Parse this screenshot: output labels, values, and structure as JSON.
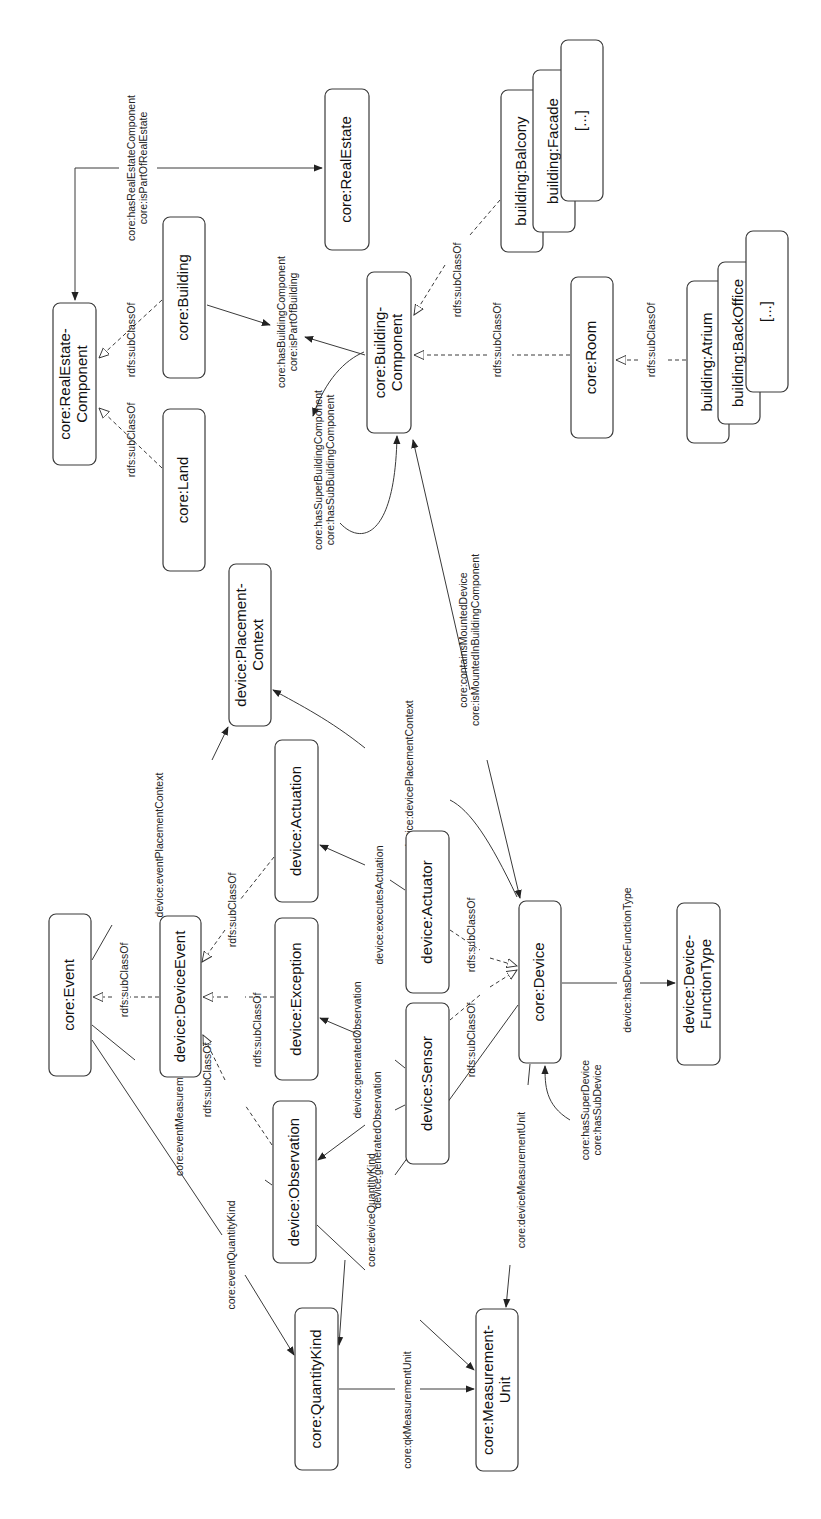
{
  "diagram": {
    "orientation": "rotated -90deg (text reads bottom-to-top)",
    "nodes": [
      {
        "id": "realestate_component",
        "lines": [
          "core:RealEstate-",
          "Component"
        ],
        "x": 53,
        "y": 303,
        "w": 43,
        "h": 162
      },
      {
        "id": "realestate",
        "lines": [
          "core:RealEstate"
        ],
        "x": 325,
        "y": 89,
        "w": 44,
        "h": 161
      },
      {
        "id": "building",
        "lines": [
          "core:Building"
        ],
        "x": 163,
        "y": 217,
        "w": 42,
        "h": 161
      },
      {
        "id": "land",
        "lines": [
          "core:Land"
        ],
        "x": 163,
        "y": 409,
        "w": 42,
        "h": 162
      },
      {
        "id": "building_component",
        "lines": [
          "core:Building-",
          "Component"
        ],
        "x": 367,
        "y": 272,
        "w": 44,
        "h": 161
      },
      {
        "id": "room",
        "lines": [
          "core:Room"
        ],
        "x": 571,
        "y": 277,
        "w": 42,
        "h": 161
      },
      {
        "id": "balcony",
        "lines": [
          "building:Balcony"
        ],
        "x": 501,
        "y": 90,
        "w": 42,
        "h": 162
      },
      {
        "id": "facade",
        "lines": [
          "building:Facade"
        ],
        "x": 533,
        "y": 70,
        "w": 42,
        "h": 162
      },
      {
        "id": "bc_more",
        "lines": [
          "[...]"
        ],
        "x": 561,
        "y": 40,
        "w": 42,
        "h": 161
      },
      {
        "id": "atrium",
        "lines": [
          "building:Atrium"
        ],
        "x": 687,
        "y": 281,
        "w": 42,
        "h": 162
      },
      {
        "id": "backoffice",
        "lines": [
          "building:BackOffice"
        ],
        "x": 718,
        "y": 262,
        "w": 42,
        "h": 162
      },
      {
        "id": "room_more",
        "lines": [
          "[...]"
        ],
        "x": 746,
        "y": 231,
        "w": 42,
        "h": 161
      },
      {
        "id": "placement_context",
        "lines": [
          "device:Placement-",
          "Context"
        ],
        "x": 229,
        "y": 564,
        "w": 42,
        "h": 162
      },
      {
        "id": "event",
        "lines": [
          "core:Event"
        ],
        "x": 49,
        "y": 914,
        "w": 42,
        "h": 162
      },
      {
        "id": "device_event",
        "lines": [
          "device:DeviceEvent"
        ],
        "x": 160,
        "y": 916,
        "w": 41,
        "h": 161
      },
      {
        "id": "actuation",
        "lines": [
          "device:Actuation"
        ],
        "x": 275,
        "y": 740,
        "w": 43,
        "h": 162
      },
      {
        "id": "exception",
        "lines": [
          "device:Exception"
        ],
        "x": 275,
        "y": 918,
        "w": 43,
        "h": 162
      },
      {
        "id": "observation",
        "lines": [
          "device:Observation"
        ],
        "x": 273,
        "y": 1101,
        "w": 43,
        "h": 162
      },
      {
        "id": "actuator",
        "lines": [
          "device:Actuator"
        ],
        "x": 406,
        "y": 831,
        "w": 43,
        "h": 162
      },
      {
        "id": "sensor",
        "lines": [
          "device:Sensor"
        ],
        "x": 406,
        "y": 1003,
        "w": 43,
        "h": 161
      },
      {
        "id": "device",
        "lines": [
          "core:Device"
        ],
        "x": 519,
        "y": 901,
        "w": 42,
        "h": 162
      },
      {
        "id": "function_type",
        "lines": [
          "device:Device-",
          "FunctionType"
        ],
        "x": 677,
        "y": 903,
        "w": 43,
        "h": 162
      },
      {
        "id": "quantity_kind",
        "lines": [
          "core:QuantityKind"
        ],
        "x": 295,
        "y": 1308,
        "w": 43,
        "h": 162
      },
      {
        "id": "measurement_unit",
        "lines": [
          "core:Measurement-",
          "Unit"
        ],
        "x": 476,
        "y": 1309,
        "w": 42,
        "h": 162
      }
    ],
    "edges": [
      {
        "id": "e_re_has_component",
        "style": "solid",
        "arrow": "filled",
        "path": "M 119 168 L 75 168 L 75 300",
        "label_lines": [
          "core:hasRealEstateComponent",
          "core:isPartOfRealEstate"
        ],
        "lx": 138,
        "ly": 168
      },
      {
        "id": "e_re_part",
        "style": "solid",
        "arrow": "filled",
        "path": "M 157 168 L 322 168",
        "label_lines": [],
        "lx": 0,
        "ly": 0
      },
      {
        "id": "e_building_sub",
        "style": "dashed",
        "arrow": "hollow",
        "path": "M 162 300 L 99 358",
        "label_lines": [
          "rdfs:subClassOf"
        ],
        "lx": 132,
        "ly": 340
      },
      {
        "id": "e_land_sub",
        "style": "dashed",
        "arrow": "hollow",
        "path": "M 162 468 L 99 408",
        "label_lines": [
          "rdfs:subClassOf"
        ],
        "lx": 132,
        "ly": 440
      },
      {
        "id": "e_building_has_bc",
        "style": "solid",
        "arrow": "both",
        "path": "M 207 305 L 270 325 M 305 337 L 365 355",
        "label_lines": [
          "core:hasBuildingComponent",
          "core:isPartOfBuilding"
        ],
        "lx": 288,
        "ly": 322
      },
      {
        "id": "e_bc_self",
        "style": "solid",
        "arrow": "both",
        "path": "M 340 523 C 360 545 395 540 397 436 M 313 416 C 325 380 345 360 364 352",
        "label_lines": [
          "core:hasSuperBuildingComponent",
          "core:hasSubBuildingComponent"
        ],
        "lx": 325,
        "ly": 470
      },
      {
        "id": "e_balcony_sub",
        "style": "dashed",
        "arrow": "hollow",
        "path": "M 500 200 L 470 235 M 445 265 L 414 315",
        "label_lines": [
          "rdfs:subClassOf"
        ],
        "lx": 458,
        "ly": 280
      },
      {
        "id": "e_room_sub",
        "style": "dashed",
        "arrow": "hollow",
        "path": "M 570 355 L 512 355 M 487 355 L 414 355",
        "label_lines": [
          "rdfs:subClassOf"
        ],
        "lx": 498,
        "ly": 340
      },
      {
        "id": "e_atrium_sub",
        "style": "dashed",
        "arrow": "hollow",
        "path": "M 686 360 L 665 360 M 638 360 L 616 360",
        "label_lines": [
          "rdfs:subClassOf"
        ],
        "lx": 652,
        "ly": 340
      },
      {
        "id": "e_mounted",
        "style": "solid",
        "arrow": "both",
        "path": "M 487 760 L 520 898 M 413 440 L 470 690",
        "label_lines": [
          "core:containsMountedDevice",
          "core:isMountedInBuildingComponent"
        ],
        "lx": 470,
        "ly": 640
      },
      {
        "id": "e_device_placement",
        "style": "solid",
        "arrow": "filled",
        "path": "M 517 897 C 490 840 470 810 450 800 M 365 748 C 330 720 300 705 273 690",
        "label_lines": [
          "device:devicePlacementContext"
        ],
        "lx": 410,
        "ly": 775
      },
      {
        "id": "e_event_placement",
        "style": "solid",
        "arrow": "filled",
        "path": "M 92 960 L 112 925 M 212 760 L 228 727",
        "label_lines": [
          "device:eventPlacementContext"
        ],
        "lx": 160,
        "ly": 845
      },
      {
        "id": "e_deviceevent_sub",
        "style": "dashed",
        "arrow": "hollow",
        "path": "M 159 997 L 130 997 M 112 997 L 93 997",
        "label_lines": [
          "rdfs:subClassOf"
        ],
        "lx": 125,
        "ly": 980
      },
      {
        "id": "e_actuation_sub",
        "style": "dashed",
        "arrow": "hollow",
        "path": "M 274 857 L 240 900 M 225 930 L 202 962",
        "label_lines": [
          "rdfs:subClassOf"
        ],
        "lx": 233,
        "ly": 910
      },
      {
        "id": "e_exception_sub",
        "style": "dashed",
        "arrow": "hollow",
        "path": "M 274 997 L 245 997 M 228 997 L 203 997",
        "label_lines": [
          "rdfs:subClassOf"
        ],
        "lx": 258,
        "ly": 1030
      },
      {
        "id": "e_observation_sub",
        "style": "dashed",
        "arrow": "hollow",
        "path": "M 272 1145 L 245 1105 M 225 1080 L 203 1035",
        "label_lines": [
          "rdfs:subClassOf"
        ],
        "lx": 208,
        "ly": 1080
      },
      {
        "id": "e_event_unit",
        "style": "solid",
        "arrow": "none",
        "path": "M 92 1025 L 135 1060 M 265 1180 L 272 1185",
        "label_lines": [
          "core:eventMeasurementUnit"
        ],
        "lx": 180,
        "ly": 1110
      },
      {
        "id": "e_event_qk",
        "style": "solid",
        "arrow": "filled",
        "path": "M 92 1040 L 222 1235 M 245 1275 L 294 1355",
        "label_lines": [
          "core:eventQuantityKind"
        ],
        "lx": 232,
        "ly": 1255
      },
      {
        "id": "e_obs_unit",
        "style": "solid",
        "arrow": "filled",
        "path": "M 317 1225 L 365 1270 M 420 1320 L 474 1370",
        "label_lines": [],
        "lx": 0,
        "ly": 0
      },
      {
        "id": "e_device_qk",
        "style": "solid",
        "arrow": "filled",
        "path": "M 518 1005 L 395 1175 M 345 1260 L 339 1345",
        "label_lines": [
          "core:deviceQuantityKind"
        ],
        "lx": 372,
        "ly": 1210
      },
      {
        "id": "e_qk_unit",
        "style": "solid",
        "arrow": "filled",
        "path": "M 339 1389 L 395 1389 M 420 1389 L 474 1389",
        "label_lines": [
          "core:qkMeasurementUnit"
        ],
        "lx": 408,
        "ly": 1410
      },
      {
        "id": "e_device_unit",
        "style": "solid",
        "arrow": "filled",
        "path": "M 530 1064 L 528 1085 M 510 1265 L 506 1307",
        "label_lines": [
          "core:deviceMeasurementUnit"
        ],
        "lx": 522,
        "ly": 1180
      },
      {
        "id": "e_device_self",
        "style": "solid",
        "arrow": "filled",
        "path": "M 570 1120 C 545 1105 545 1085 545 1066",
        "label_lines": [
          "core:hasSuperDevice",
          "core:hasSubDevice"
        ],
        "lx": 592,
        "ly": 1110
      },
      {
        "id": "e_device_func",
        "style": "solid",
        "arrow": "filled",
        "path": "M 562 983 L 617 983 M 640 983 L 675 983",
        "label_lines": [
          "device:hasDeviceFunctionType"
        ],
        "lx": 628,
        "ly": 960
      },
      {
        "id": "e_sensor_sub",
        "style": "dashed",
        "arrow": "hollow",
        "path": "M 450 1020 L 480 995 M 490 987 L 517 970",
        "label_lines": [
          "rdfs:subClassOf"
        ],
        "lx": 472,
        "ly": 1040
      },
      {
        "id": "e_actuator_sub",
        "style": "dashed",
        "arrow": "hollow",
        "path": "M 450 930 L 480 950 M 490 958 L 517 966",
        "label_lines": [
          "rdfs:subClassOf"
        ],
        "lx": 472,
        "ly": 935
      },
      {
        "id": "e_actuator_actuation",
        "style": "solid",
        "arrow": "filled",
        "path": "M 405 890 L 390 880 M 365 865 L 320 845",
        "label_lines": [
          "device:executesActuation"
        ],
        "lx": 380,
        "ly": 905
      },
      {
        "id": "e_sensor_exception",
        "style": "solid",
        "arrow": "filled",
        "path": "M 405 1068 L 395 1060 M 360 1035 L 320 1018",
        "label_lines": [
          "device:generatedObservation"
        ],
        "lx": 358,
        "ly": 1050
      },
      {
        "id": "e_sensor_observation",
        "style": "solid",
        "arrow": "filled",
        "path": "M 405 1105 L 395 1110 M 365 1125 L 318 1160",
        "label_lines": [
          "device:generatedObservation"
        ],
        "lx": 378,
        "ly": 1140
      }
    ]
  }
}
